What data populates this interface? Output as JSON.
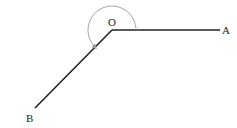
{
  "diagram": {
    "type": "reflex-angle",
    "points": {
      "O": {
        "label": "O",
        "x": 112,
        "y": 30
      },
      "A": {
        "label": "A",
        "x": 220,
        "y": 30
      },
      "B": {
        "label": "B",
        "x": 35,
        "y": 108
      }
    },
    "rays": [
      {
        "from": "O",
        "to": "A"
      },
      {
        "from": "O",
        "to": "B"
      }
    ],
    "angle_arc": {
      "vertex": "O",
      "start": "A",
      "end": "B",
      "direction": "counterclockwise",
      "radius": 24,
      "arrow": true
    },
    "colors": {
      "line": "#222222",
      "arc": "#999999"
    }
  }
}
